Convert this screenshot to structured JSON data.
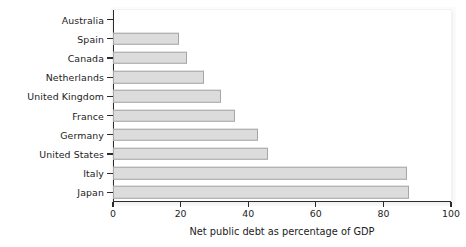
{
  "chart_data": {
    "type": "bar",
    "orientation": "horizontal",
    "title": "",
    "xlabel": "Net public debt as percentage of GDP",
    "ylabel": "",
    "categories": [
      "Australia",
      "Spain",
      "Canada",
      "Netherlands",
      "United Kingdom",
      "France",
      "Germany",
      "United States",
      "Italy",
      "Japan"
    ],
    "values": [
      0,
      19.5,
      22,
      27,
      32,
      36,
      43,
      46,
      87,
      87.5
    ],
    "xlim": [
      0,
      100
    ],
    "xticks": [
      0,
      20,
      40,
      60,
      80,
      100
    ],
    "xticklabels": [
      "0",
      "20",
      "40",
      "60",
      "80",
      "100"
    ],
    "grid": false,
    "legend": null,
    "bar_color": "#dcdcdc",
    "bar_edge_color": "#a6a6a6",
    "axis_color": "#2b2b2b",
    "background_color": "#ffffff"
  }
}
